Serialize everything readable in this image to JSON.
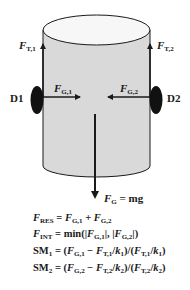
{
  "diagram": {
    "colors": {
      "cylinder_fill": "#d9d9d9",
      "top_fill": "#f7f7f7",
      "stroke": "#1a1a1a",
      "disc": "#111111"
    },
    "labels": {
      "ft1": {
        "sym": "F",
        "sub": "T,1"
      },
      "ft2": {
        "sym": "F",
        "sub": "T,2"
      },
      "fg1": {
        "sym": "F",
        "sub": "G,1"
      },
      "fg2": {
        "sym": "F",
        "sub": "G,2"
      },
      "d1": "D1",
      "d2": "D2",
      "fg": {
        "sym": "F",
        "sub": "G",
        "rhs": " = mg"
      }
    },
    "equations": [
      {
        "lhs_sym": "F",
        "lhs_sub": "RES",
        "rhs": "= F_G,1 + F_G,2"
      },
      {
        "lhs_sym": "F",
        "lhs_sub": "INT",
        "rhs": "= min(|F_G,1|, |F_G,2|)"
      },
      {
        "lhs_sym": "SM",
        "lhs_sub": "1",
        "rhs": "= (F_G,1 − F_T,1/k_1)/(F_T,1/k_1)"
      },
      {
        "lhs_sym": "SM",
        "lhs_sub": "2",
        "rhs": "= (F_G,2 − F_T,2/k_2)/(F_T,2/k_2)"
      }
    ],
    "eq_parts": {
      "eq1": {
        "F": "F",
        "RES": "RES",
        "eqsign": " = ",
        "F1": "F",
        "G1": "G,1",
        "plus": " + ",
        "F2": "F",
        "G2": "G,2"
      },
      "eq2": {
        "F": "F",
        "INT": "INT",
        "eqsign": " = min(|",
        "F1": "F",
        "G1": "G,1",
        "mid": "|, |",
        "F2": "F",
        "G2": "G,2",
        "end": "|)"
      },
      "eq3": {
        "SM": "SM",
        "n": "1",
        "a": " = (",
        "F1": "F",
        "s1": "G,1",
        "b": " − ",
        "F2": "F",
        "s2": "T,1",
        "c": "/",
        "k": "k",
        "kn": "1",
        "d": ")/(",
        "F3": "F",
        "s3": "T,1",
        "e": "/",
        "k2": "k",
        "kn2": "1",
        "f": ")"
      },
      "eq4": {
        "SM": "SM",
        "n": "2",
        "a": " = (",
        "F1": "F",
        "s1": "G,2",
        "b": " − ",
        "F2": "F",
        "s2": "T,2",
        "c": "/",
        "k": "k",
        "kn": "2",
        "d": ")/(",
        "F3": "F",
        "s3": "T,2",
        "e": "/",
        "k2": "k",
        "kn2": "2",
        "f": ")"
      }
    }
  }
}
